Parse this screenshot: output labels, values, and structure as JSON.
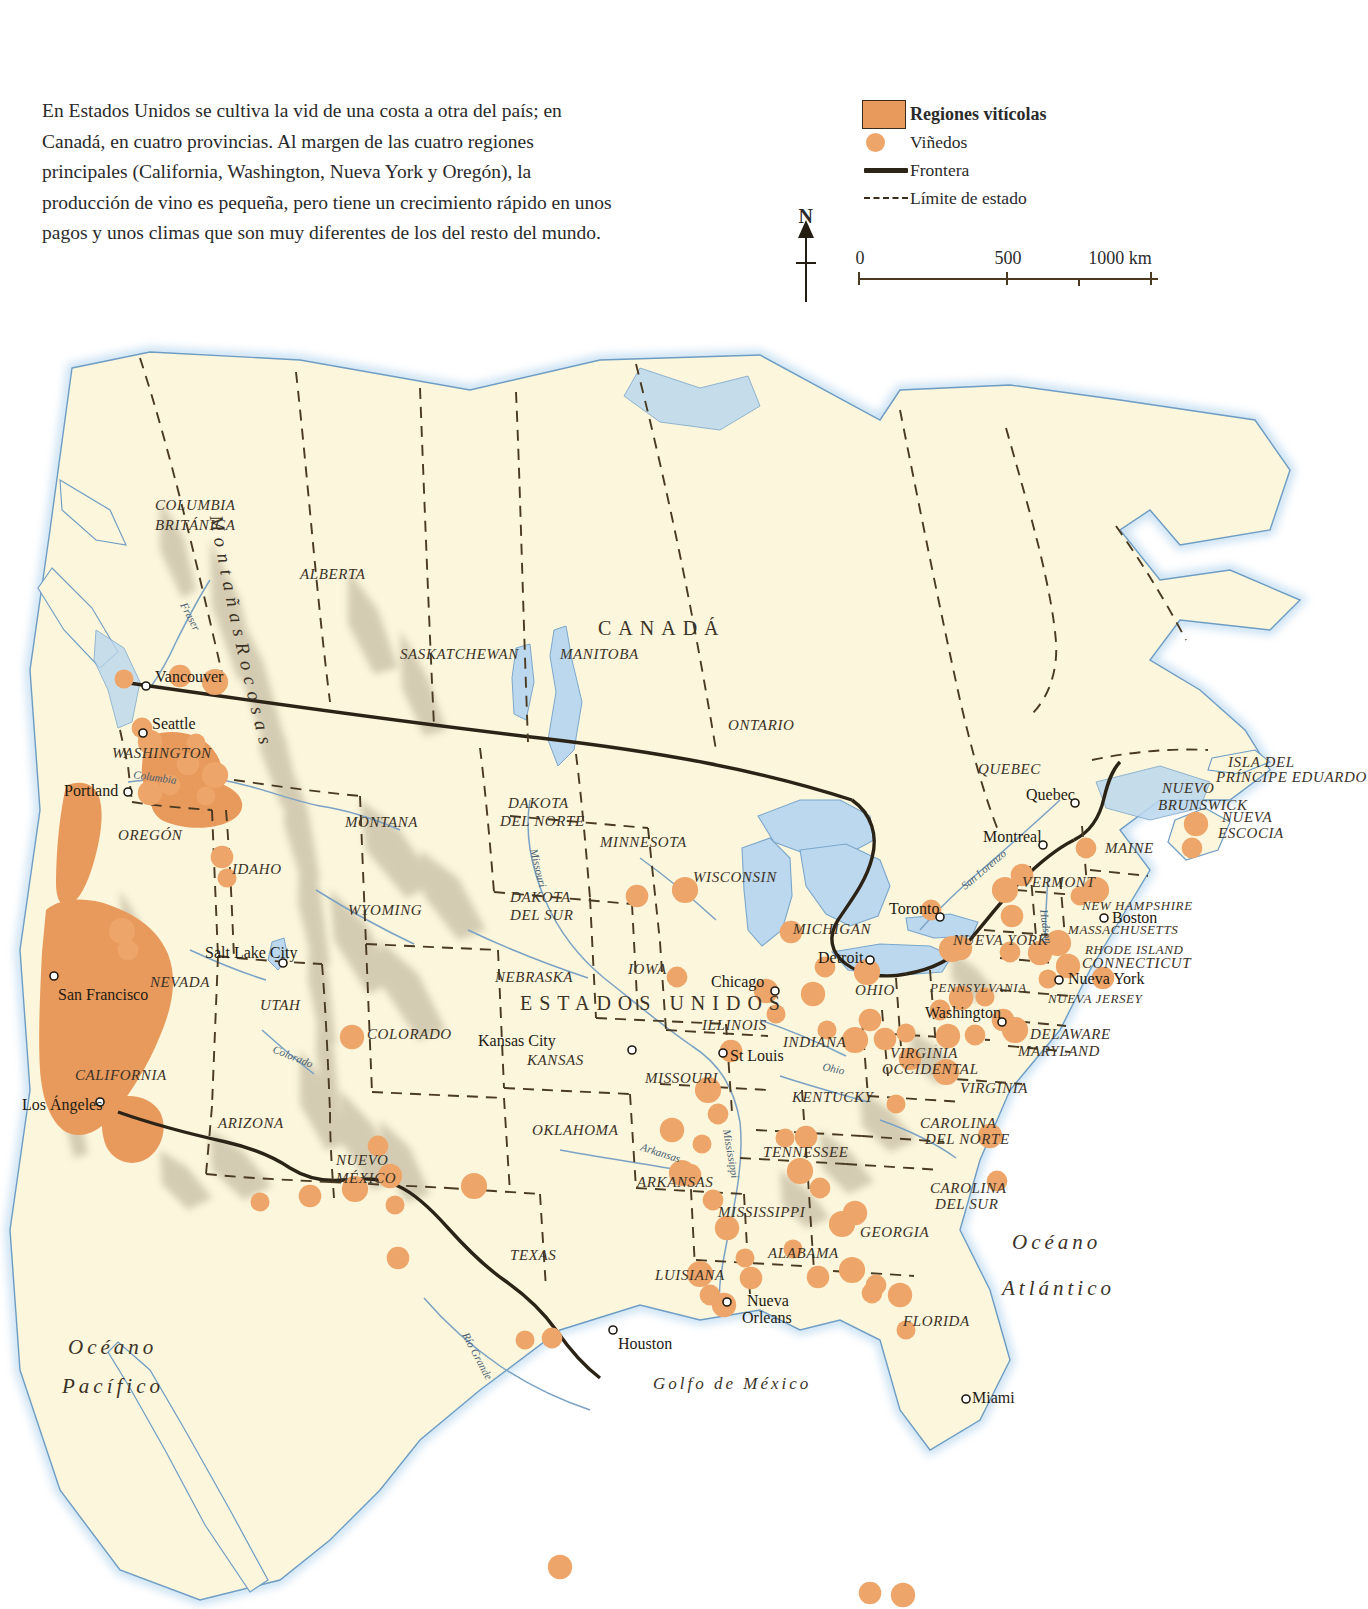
{
  "intro": {
    "text": "En Estados Unidos se cultiva la vid de una costa a otra del país; en Canadá, en cuatro provincias. Al margen de las cuatro regiones principales (California, Washington, Nueva York y Oregón), la producción de vino es pequeña, pero tiene un crecimiento rápido en unos pagos y unos climas que son muy diferentes de los del resto del mundo."
  },
  "legend": {
    "items": [
      {
        "label": "Regiones vitícolas",
        "key": "swatch-box",
        "bold": true
      },
      {
        "label": "Viñedos",
        "key": "swatch-dot",
        "bold": false
      },
      {
        "label": "Frontera",
        "key": "swatch-border",
        "bold": false
      },
      {
        "label": "Límite de estado",
        "key": "swatch-state",
        "bold": false
      }
    ]
  },
  "compass": {
    "north_label": "N"
  },
  "scale": {
    "ticks": [
      "0",
      "500",
      "1000 km"
    ],
    "positions": [
      0,
      50,
      100
    ]
  },
  "colors": {
    "wine_region": "#e89a5c",
    "vineyard_dot": "#eda569",
    "land": "#fbf6dc",
    "water": "#ffffff",
    "lake": "#bcd8ee",
    "border_line": "#2c2317",
    "state_line": "#3a2d1e",
    "river": "#7ba2c4"
  },
  "map": {
    "countries": [
      {
        "name": "CANADÁ",
        "x": 598,
        "y": 305
      },
      {
        "name": "ESTADOS UNIDOS",
        "x": 520,
        "y": 680
      }
    ],
    "provinces": [
      {
        "name": "COLUMBIA",
        "x": 155,
        "y": 180
      },
      {
        "name": "BRITÁNICA",
        "x": 155,
        "y": 200
      },
      {
        "name": "ALBERTA",
        "x": 300,
        "y": 249
      },
      {
        "name": "SASKATCHEWAN",
        "x": 400,
        "y": 329
      },
      {
        "name": "MANITOBA",
        "x": 560,
        "y": 329
      },
      {
        "name": "ONTARIO",
        "x": 728,
        "y": 400
      },
      {
        "name": "QUEBEC",
        "x": 978,
        "y": 444
      },
      {
        "name": "NUEVO",
        "x": 1162,
        "y": 463
      },
      {
        "name": "BRUNSWICK",
        "x": 1158,
        "y": 480
      },
      {
        "name": "NUEVA",
        "x": 1222,
        "y": 492
      },
      {
        "name": "ESCOCIA",
        "x": 1218,
        "y": 508
      },
      {
        "name": "ISLA DEL",
        "x": 1228,
        "y": 437
      },
      {
        "name": "PRÍNCIPE EDUARDO",
        "x": 1216,
        "y": 452
      }
    ],
    "states": [
      {
        "name": "WASHINGTON",
        "x": 112,
        "y": 428
      },
      {
        "name": "OREGÓN",
        "x": 118,
        "y": 510
      },
      {
        "name": "IDAHO",
        "x": 232,
        "y": 544
      },
      {
        "name": "MONTANA",
        "x": 345,
        "y": 497
      },
      {
        "name": "WYOMING",
        "x": 348,
        "y": 585
      },
      {
        "name": "NEVADA",
        "x": 150,
        "y": 657
      },
      {
        "name": "UTAH",
        "x": 260,
        "y": 680
      },
      {
        "name": "COLORADO",
        "x": 367,
        "y": 709
      },
      {
        "name": "CALIFORNIA",
        "x": 75,
        "y": 750
      },
      {
        "name": "ARIZONA",
        "x": 218,
        "y": 798
      },
      {
        "name": "NUEVO",
        "x": 336,
        "y": 835
      },
      {
        "name": "MÉXICO",
        "x": 336,
        "y": 853
      },
      {
        "name": "TEXAS",
        "x": 510,
        "y": 930
      },
      {
        "name": "DAKOTA",
        "x": 508,
        "y": 478
      },
      {
        "name": "DEL NORTE",
        "x": 500,
        "y": 496
      },
      {
        "name": "DAKOTA",
        "x": 510,
        "y": 572
      },
      {
        "name": "DEL SUR",
        "x": 510,
        "y": 590
      },
      {
        "name": "NEBRASKA",
        "x": 495,
        "y": 652
      },
      {
        "name": "KANSAS",
        "x": 527,
        "y": 735
      },
      {
        "name": "OKLAHOMA",
        "x": 532,
        "y": 805
      },
      {
        "name": "MINNESOTA",
        "x": 600,
        "y": 517
      },
      {
        "name": "IOWA",
        "x": 628,
        "y": 644
      },
      {
        "name": "MISSOURI",
        "x": 645,
        "y": 753
      },
      {
        "name": "ARKANSAS",
        "x": 637,
        "y": 857
      },
      {
        "name": "LUISIANA",
        "x": 655,
        "y": 950
      },
      {
        "name": "WISCONSIN",
        "x": 693,
        "y": 552
      },
      {
        "name": "ILLINOIS",
        "x": 702,
        "y": 700
      },
      {
        "name": "MICHIGAN",
        "x": 793,
        "y": 604
      },
      {
        "name": "INDIANA",
        "x": 783,
        "y": 717
      },
      {
        "name": "OHIO",
        "x": 855,
        "y": 665
      },
      {
        "name": "KENTUCKY",
        "x": 792,
        "y": 772
      },
      {
        "name": "TENNESSEE",
        "x": 763,
        "y": 827
      },
      {
        "name": "MISSISSIPPI",
        "x": 718,
        "y": 887
      },
      {
        "name": "ALABAMA",
        "x": 768,
        "y": 928
      },
      {
        "name": "GEORGIA",
        "x": 860,
        "y": 907
      },
      {
        "name": "FLORIDA",
        "x": 903,
        "y": 996
      },
      {
        "name": "CAROLINA",
        "x": 920,
        "y": 798
      },
      {
        "name": "DEL NORTE",
        "x": 925,
        "y": 814
      },
      {
        "name": "CAROLINA",
        "x": 930,
        "y": 863
      },
      {
        "name": "DEL SUR",
        "x": 935,
        "y": 879
      },
      {
        "name": "VIRGINIA",
        "x": 890,
        "y": 728
      },
      {
        "name": "OCCIDENTAL",
        "x": 882,
        "y": 744
      },
      {
        "name": "VIRGINIA",
        "x": 960,
        "y": 763
      },
      {
        "name": "PENNSYLVANIA",
        "x": 930,
        "y": 662
      },
      {
        "name": "NUEVA YORK",
        "x": 953,
        "y": 615
      },
      {
        "name": "VERMONT",
        "x": 1022,
        "y": 557
      },
      {
        "name": "NEW HAMPSHIRE",
        "x": 1082,
        "y": 580
      },
      {
        "name": "MASSACHUSETTS",
        "x": 1068,
        "y": 604
      },
      {
        "name": "RHODE ISLAND",
        "x": 1085,
        "y": 624
      },
      {
        "name": "CONNECTICUT",
        "x": 1082,
        "y": 638
      },
      {
        "name": "NUEVA JERSEY",
        "x": 1048,
        "y": 673
      },
      {
        "name": "DELAWARE",
        "x": 1030,
        "y": 709
      },
      {
        "name": "MARYLAND",
        "x": 1018,
        "y": 726
      },
      {
        "name": "MAINE",
        "x": 1105,
        "y": 523
      }
    ],
    "cities": [
      {
        "name": "Vancouver",
        "x": 155,
        "y": 352,
        "px": 146,
        "py": 356
      },
      {
        "name": "Seattle",
        "x": 152,
        "y": 399,
        "px": 143,
        "py": 403
      },
      {
        "name": "Portland",
        "x": 64,
        "y": 466,
        "px": 128,
        "py": 462
      },
      {
        "name": "San Francisco",
        "x": 58,
        "y": 670,
        "px": 54,
        "py": 646
      },
      {
        "name": "Los Ángeles",
        "x": 22,
        "y": 780,
        "px": 100,
        "py": 772
      },
      {
        "name": "Salt Lake City",
        "x": 205,
        "y": 628,
        "px": 283,
        "py": 633
      },
      {
        "name": "Kansas City",
        "x": 478,
        "y": 716,
        "px": 632,
        "py": 720
      },
      {
        "name": "St Louis",
        "x": 730,
        "y": 731,
        "px": 723,
        "py": 723
      },
      {
        "name": "Chicago",
        "x": 711,
        "y": 657,
        "px": 775,
        "py": 661
      },
      {
        "name": "Detroit",
        "x": 818,
        "y": 633,
        "px": 870,
        "py": 630
      },
      {
        "name": "Toronto",
        "x": 889,
        "y": 584,
        "px": 940,
        "py": 587
      },
      {
        "name": "Montreal",
        "x": 983,
        "y": 512,
        "px": 1043,
        "py": 515
      },
      {
        "name": "Quebec",
        "x": 1026,
        "y": 470,
        "px": 1075,
        "py": 473
      },
      {
        "name": "Boston",
        "x": 1112,
        "y": 593,
        "px": 1104,
        "py": 588
      },
      {
        "name": "Nueva York",
        "x": 1068,
        "y": 654,
        "px": 1059,
        "py": 650
      },
      {
        "name": "Washington",
        "x": 925,
        "y": 688,
        "px": 1002,
        "py": 692
      },
      {
        "name": "Houston",
        "x": 618,
        "y": 1019,
        "px": 613,
        "py": 1000
      },
      {
        "name": "Nueva",
        "x": 747,
        "y": 976,
        "px": 727,
        "py": 972
      },
      {
        "name": "Orleans",
        "x": 742,
        "y": 993,
        "px": -1,
        "py": -1
      },
      {
        "name": "Miami",
        "x": 972,
        "y": 1073,
        "px": 966,
        "py": 1069
      }
    ],
    "waters": [
      {
        "name": "Océano",
        "x": 1012,
        "y": 919,
        "class": "ocean"
      },
      {
        "name": "Atlántico",
        "x": 1002,
        "y": 965,
        "class": "ocean"
      },
      {
        "name": "Océano",
        "x": 68,
        "y": 1024,
        "class": "ocean"
      },
      {
        "name": "Pacífico",
        "x": 62,
        "y": 1063,
        "class": "ocean"
      },
      {
        "name": "Golfo de México",
        "x": 653,
        "y": 1059,
        "class": "gulf"
      }
    ],
    "rivers": [
      {
        "name": "Fraser",
        "x": 180,
        "y": 275,
        "rot": 62
      },
      {
        "name": "Columbia",
        "x": 133,
        "y": 448,
        "rot": 8
      },
      {
        "name": "Missouri",
        "x": 530,
        "y": 520,
        "rot": 76
      },
      {
        "name": "Colorado",
        "x": 272,
        "y": 722,
        "rot": 22
      },
      {
        "name": "Arkansas",
        "x": 640,
        "y": 820,
        "rot": 18
      },
      {
        "name": "Mississippi",
        "x": 723,
        "y": 800,
        "rot": 80
      },
      {
        "name": "Ohio",
        "x": 822,
        "y": 740,
        "rot": 12
      },
      {
        "name": "Río Grande",
        "x": 462,
        "y": 1005,
        "rot": 62
      },
      {
        "name": "San Lorenzo",
        "x": 965,
        "y": 560,
        "rot": -40
      },
      {
        "name": "Hudson",
        "x": 1040,
        "y": 580,
        "rot": 82
      }
    ],
    "rockies_label": "M o n t a ñ a s   R o c o s a s",
    "vineyards": [
      {
        "x": 124,
        "y": 349
      },
      {
        "x": 180,
        "y": 346
      },
      {
        "x": 215,
        "y": 352
      },
      {
        "x": 142,
        "y": 398
      },
      {
        "x": 150,
        "y": 412
      },
      {
        "x": 196,
        "y": 413
      },
      {
        "x": 188,
        "y": 434
      },
      {
        "x": 215,
        "y": 445
      },
      {
        "x": 170,
        "y": 455
      },
      {
        "x": 150,
        "y": 463
      },
      {
        "x": 206,
        "y": 466
      },
      {
        "x": 222,
        "y": 527
      },
      {
        "x": 122,
        "y": 601
      },
      {
        "x": 128,
        "y": 620
      },
      {
        "x": 352,
        "y": 707
      },
      {
        "x": 260,
        "y": 872
      },
      {
        "x": 310,
        "y": 866
      },
      {
        "x": 355,
        "y": 859
      },
      {
        "x": 378,
        "y": 816
      },
      {
        "x": 390,
        "y": 846
      },
      {
        "x": 395,
        "y": 875
      },
      {
        "x": 398,
        "y": 928
      },
      {
        "x": 474,
        "y": 856
      },
      {
        "x": 552,
        "y": 1008
      },
      {
        "x": 560,
        "y": 1237
      },
      {
        "x": 525,
        "y": 1010
      },
      {
        "x": 637,
        "y": 566
      },
      {
        "x": 685,
        "y": 560
      },
      {
        "x": 677,
        "y": 647
      },
      {
        "x": 766,
        "y": 661
      },
      {
        "x": 776,
        "y": 684
      },
      {
        "x": 731,
        "y": 721
      },
      {
        "x": 708,
        "y": 760
      },
      {
        "x": 718,
        "y": 784
      },
      {
        "x": 672,
        "y": 800
      },
      {
        "x": 702,
        "y": 814
      },
      {
        "x": 690,
        "y": 845
      },
      {
        "x": 682,
        "y": 843
      },
      {
        "x": 713,
        "y": 870
      },
      {
        "x": 727,
        "y": 898
      },
      {
        "x": 745,
        "y": 928
      },
      {
        "x": 751,
        "y": 948
      },
      {
        "x": 700,
        "y": 944
      },
      {
        "x": 710,
        "y": 965
      },
      {
        "x": 724,
        "y": 975
      },
      {
        "x": 785,
        "y": 808
      },
      {
        "x": 806,
        "y": 807
      },
      {
        "x": 800,
        "y": 841
      },
      {
        "x": 820,
        "y": 858
      },
      {
        "x": 855,
        "y": 883
      },
      {
        "x": 793,
        "y": 919
      },
      {
        "x": 818,
        "y": 947
      },
      {
        "x": 852,
        "y": 940
      },
      {
        "x": 876,
        "y": 955
      },
      {
        "x": 900,
        "y": 965
      },
      {
        "x": 906,
        "y": 1000
      },
      {
        "x": 870,
        "y": 1263
      },
      {
        "x": 842,
        "y": 894
      },
      {
        "x": 997,
        "y": 851
      },
      {
        "x": 990,
        "y": 806
      },
      {
        "x": 896,
        "y": 774
      },
      {
        "x": 910,
        "y": 729
      },
      {
        "x": 946,
        "y": 742
      },
      {
        "x": 872,
        "y": 963
      },
      {
        "x": 903,
        "y": 1265
      },
      {
        "x": 227,
        "y": 548
      },
      {
        "x": 791,
        "y": 602
      },
      {
        "x": 867,
        "y": 642
      },
      {
        "x": 825,
        "y": 637
      },
      {
        "x": 813,
        "y": 664
      },
      {
        "x": 827,
        "y": 700
      },
      {
        "x": 870,
        "y": 690
      },
      {
        "x": 855,
        "y": 710
      },
      {
        "x": 940,
        "y": 680
      },
      {
        "x": 961,
        "y": 668
      },
      {
        "x": 985,
        "y": 667
      },
      {
        "x": 1003,
        "y": 690
      },
      {
        "x": 1015,
        "y": 700
      },
      {
        "x": 975,
        "y": 705
      },
      {
        "x": 948,
        "y": 706
      },
      {
        "x": 906,
        "y": 703
      },
      {
        "x": 885,
        "y": 709
      },
      {
        "x": 952,
        "y": 619
      },
      {
        "x": 1010,
        "y": 622
      },
      {
        "x": 1040,
        "y": 623
      },
      {
        "x": 1060,
        "y": 610
      },
      {
        "x": 1012,
        "y": 586
      },
      {
        "x": 1096,
        "y": 560
      },
      {
        "x": 1086,
        "y": 518
      },
      {
        "x": 1068,
        "y": 636
      },
      {
        "x": 1048,
        "y": 649
      },
      {
        "x": 1103,
        "y": 648
      },
      {
        "x": 1058,
        "y": 613
      },
      {
        "x": 1192,
        "y": 518
      },
      {
        "x": 1196,
        "y": 494
      },
      {
        "x": 1080,
        "y": 566
      },
      {
        "x": 1022,
        "y": 545
      },
      {
        "x": 1005,
        "y": 560
      },
      {
        "x": 931,
        "y": 580
      },
      {
        "x": 960,
        "y": 618
      }
    ]
  }
}
